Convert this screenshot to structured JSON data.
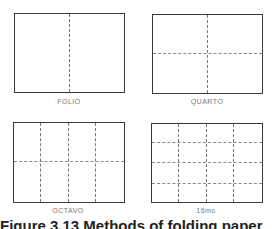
{
  "figure": {
    "panels": [
      {
        "label": "FOLIO",
        "cols": 2,
        "rows": 1
      },
      {
        "label": "QUARTO",
        "cols": 2,
        "rows": 2
      },
      {
        "label": "OCTAVO",
        "cols": 4,
        "rows": 2
      },
      {
        "label": "16mo",
        "cols": 4,
        "rows": 4
      }
    ],
    "caption": "Figure 3.13 Methods of folding paper"
  }
}
